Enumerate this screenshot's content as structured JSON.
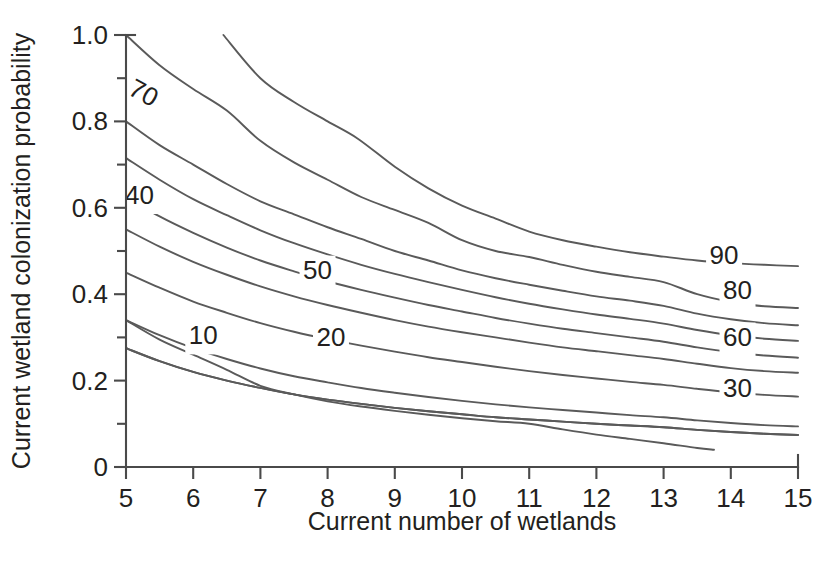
{
  "figure": {
    "clipped_title": "",
    "background_color": "#ffffff",
    "line_color": "#5a5a5a",
    "axis_color": "#4a4a4a",
    "text_color": "#231f20"
  },
  "chart_data": {
    "type": "line",
    "title": "",
    "xlabel": "Current number of wetlands",
    "ylabel": "Current wetland colonization probability",
    "xlim": [
      5,
      15
    ],
    "ylim": [
      0,
      1.0
    ],
    "grid": false,
    "legend": "inline-contour-labels",
    "x_ticks": [
      5,
      6,
      7,
      8,
      9,
      10,
      11,
      12,
      13,
      14,
      15
    ],
    "x_tick_labels": [
      "5",
      "6",
      "7",
      "8",
      "9",
      "10",
      "11",
      "12",
      "13",
      "14",
      "15"
    ],
    "y_ticks": [
      0,
      0.2,
      0.4,
      0.6,
      0.8,
      1.0
    ],
    "y_tick_labels": [
      "0",
      "0.2",
      "0.4",
      "0.6",
      "0.8",
      "1.0"
    ],
    "y_minor_ticks": [
      0.1,
      0.3,
      0.5,
      0.7,
      0.9
    ],
    "series": [
      {
        "name": "100",
        "label": "",
        "label_x": null,
        "label_y": null,
        "points": [
          [
            6.45,
            1.0
          ],
          [
            7.0,
            0.9
          ],
          [
            7.5,
            0.845
          ],
          [
            8.0,
            0.8
          ],
          [
            8.45,
            0.76
          ],
          [
            9.0,
            0.695
          ],
          [
            9.5,
            0.645
          ],
          [
            10.0,
            0.605
          ],
          [
            10.5,
            0.575
          ],
          [
            11.0,
            0.545
          ],
          [
            11.5,
            0.525
          ],
          [
            12.0,
            0.51
          ],
          [
            12.5,
            0.497
          ],
          [
            13.0,
            0.487
          ],
          [
            13.5,
            0.478
          ],
          [
            14.0,
            0.472
          ],
          [
            14.5,
            0.468
          ],
          [
            15.0,
            0.465
          ]
        ]
      },
      {
        "name": "90",
        "label": "90",
        "label_x": 13.9,
        "label_y": 0.485,
        "points": [
          [
            5.0,
            1.0
          ],
          [
            5.5,
            0.93
          ],
          [
            6.0,
            0.875
          ],
          [
            6.5,
            0.825
          ],
          [
            7.0,
            0.755
          ],
          [
            7.5,
            0.705
          ],
          [
            8.0,
            0.665
          ],
          [
            8.5,
            0.625
          ],
          [
            9.0,
            0.595
          ],
          [
            9.5,
            0.565
          ],
          [
            10.0,
            0.525
          ],
          [
            10.5,
            0.5
          ],
          [
            11.0,
            0.486
          ],
          [
            11.5,
            0.468
          ],
          [
            12.0,
            0.452
          ],
          [
            12.5,
            0.44
          ],
          [
            13.0,
            0.428
          ],
          [
            13.5,
            0.4
          ],
          [
            14.0,
            0.382
          ],
          [
            14.5,
            0.372
          ],
          [
            15.0,
            0.368
          ]
        ]
      },
      {
        "name": "85",
        "label": "",
        "label_x": null,
        "label_y": null,
        "points": [
          [
            5.0,
            0.8
          ],
          [
            5.5,
            0.745
          ],
          [
            6.0,
            0.7
          ],
          [
            6.5,
            0.655
          ],
          [
            7.0,
            0.615
          ],
          [
            7.5,
            0.585
          ],
          [
            8.0,
            0.555
          ],
          [
            8.5,
            0.528
          ],
          [
            9.0,
            0.5
          ],
          [
            9.5,
            0.478
          ],
          [
            10.0,
            0.455
          ],
          [
            10.5,
            0.437
          ],
          [
            11.0,
            0.422
          ],
          [
            11.5,
            0.408
          ],
          [
            12.0,
            0.395
          ],
          [
            12.5,
            0.385
          ],
          [
            13.0,
            0.373
          ],
          [
            13.5,
            0.355
          ],
          [
            14.0,
            0.342
          ],
          [
            14.5,
            0.333
          ],
          [
            15.0,
            0.328
          ]
        ]
      },
      {
        "name": "80",
        "label": "80",
        "label_x": 14.1,
        "label_y": 0.405,
        "points": [
          [
            5.0,
            0.715
          ],
          [
            5.5,
            0.665
          ],
          [
            6.0,
            0.62
          ],
          [
            6.5,
            0.583
          ],
          [
            7.0,
            0.548
          ],
          [
            7.5,
            0.518
          ],
          [
            8.0,
            0.492
          ],
          [
            8.5,
            0.468
          ],
          [
            9.0,
            0.447
          ],
          [
            9.5,
            0.428
          ],
          [
            10.0,
            0.41
          ],
          [
            10.5,
            0.393
          ],
          [
            11.0,
            0.378
          ],
          [
            11.5,
            0.365
          ],
          [
            12.0,
            0.353
          ],
          [
            12.5,
            0.343
          ],
          [
            13.0,
            0.332
          ],
          [
            13.5,
            0.317
          ],
          [
            14.0,
            0.305
          ],
          [
            14.5,
            0.297
          ],
          [
            15.0,
            0.292
          ]
        ]
      },
      {
        "name": "70",
        "label": "70",
        "label_x": 5.25,
        "label_y": 0.862,
        "points": [
          [
            5.0,
            0.625
          ],
          [
            5.5,
            0.58
          ],
          [
            6.0,
            0.542
          ],
          [
            6.5,
            0.508
          ],
          [
            7.0,
            0.478
          ],
          [
            7.5,
            0.453
          ],
          [
            8.0,
            0.43
          ],
          [
            8.5,
            0.41
          ],
          [
            9.0,
            0.392
          ],
          [
            9.5,
            0.375
          ],
          [
            10.0,
            0.36
          ],
          [
            10.5,
            0.345
          ],
          [
            11.0,
            0.332
          ],
          [
            11.5,
            0.32
          ],
          [
            12.0,
            0.31
          ],
          [
            12.5,
            0.3
          ],
          [
            13.0,
            0.29
          ],
          [
            13.5,
            0.277
          ],
          [
            14.0,
            0.266
          ],
          [
            14.5,
            0.258
          ],
          [
            15.0,
            0.253
          ]
        ]
      },
      {
        "name": "60",
        "label": "60",
        "label_x": 14.1,
        "label_y": 0.295,
        "points": [
          [
            5.0,
            0.55
          ],
          [
            5.5,
            0.51
          ],
          [
            6.0,
            0.475
          ],
          [
            6.5,
            0.445
          ],
          [
            7.0,
            0.418
          ],
          [
            7.5,
            0.395
          ],
          [
            8.0,
            0.375
          ],
          [
            8.5,
            0.357
          ],
          [
            9.0,
            0.34
          ],
          [
            9.5,
            0.325
          ],
          [
            10.0,
            0.312
          ],
          [
            10.5,
            0.3
          ],
          [
            11.0,
            0.288
          ],
          [
            11.5,
            0.277
          ],
          [
            12.0,
            0.268
          ],
          [
            12.5,
            0.259
          ],
          [
            13.0,
            0.25
          ],
          [
            13.5,
            0.239
          ],
          [
            14.0,
            0.229
          ],
          [
            14.5,
            0.222
          ],
          [
            15.0,
            0.218
          ]
        ]
      },
      {
        "name": "50",
        "label": "50",
        "label_x": 7.85,
        "label_y": 0.45,
        "points": [
          [
            5.0,
            0.45
          ],
          [
            5.5,
            0.415
          ],
          [
            6.0,
            0.383
          ],
          [
            6.5,
            0.357
          ],
          [
            7.0,
            0.333
          ],
          [
            7.5,
            0.313
          ],
          [
            8.0,
            0.296
          ],
          [
            8.5,
            0.281
          ],
          [
            9.0,
            0.267
          ],
          [
            9.5,
            0.254
          ],
          [
            10.0,
            0.243
          ],
          [
            10.5,
            0.232
          ],
          [
            11.0,
            0.222
          ],
          [
            11.5,
            0.213
          ],
          [
            12.0,
            0.205
          ],
          [
            12.5,
            0.197
          ],
          [
            13.0,
            0.19
          ],
          [
            13.5,
            0.181
          ],
          [
            14.0,
            0.173
          ],
          [
            14.5,
            0.167
          ],
          [
            15.0,
            0.163
          ]
        ]
      },
      {
        "name": "40",
        "label": "40",
        "label_x": 5.2,
        "label_y": 0.625,
        "points": [
          [
            5.0,
            0.34
          ],
          [
            5.5,
            0.305
          ],
          [
            6.0,
            0.275
          ],
          [
            6.5,
            0.25
          ],
          [
            7.0,
            0.228
          ],
          [
            7.5,
            0.21
          ],
          [
            8.0,
            0.196
          ],
          [
            8.5,
            0.183
          ],
          [
            9.0,
            0.172
          ],
          [
            9.5,
            0.162
          ],
          [
            10.0,
            0.153
          ],
          [
            10.5,
            0.145
          ],
          [
            11.0,
            0.138
          ],
          [
            11.5,
            0.132
          ],
          [
            12.0,
            0.126
          ],
          [
            12.5,
            0.12
          ],
          [
            13.0,
            0.115
          ],
          [
            13.5,
            0.108
          ],
          [
            14.0,
            0.102
          ],
          [
            14.5,
            0.097
          ],
          [
            15.0,
            0.094
          ]
        ]
      },
      {
        "name": "30",
        "label": "30",
        "label_x": 14.1,
        "label_y": 0.178,
        "points": [
          [
            5.0,
            0.275
          ],
          [
            5.5,
            0.245
          ],
          [
            6.0,
            0.22
          ],
          [
            6.5,
            0.2
          ],
          [
            7.0,
            0.183
          ],
          [
            7.5,
            0.168
          ],
          [
            8.0,
            0.156
          ],
          [
            8.5,
            0.146
          ],
          [
            9.0,
            0.137
          ],
          [
            9.5,
            0.129
          ],
          [
            10.0,
            0.122
          ],
          [
            10.5,
            0.115
          ],
          [
            11.0,
            0.11
          ],
          [
            11.5,
            0.105
          ],
          [
            12.0,
            0.1
          ],
          [
            12.5,
            0.096
          ],
          [
            13.0,
            0.092
          ],
          [
            13.5,
            0.086
          ],
          [
            14.0,
            0.081
          ],
          [
            14.5,
            0.077
          ],
          [
            15.0,
            0.074
          ]
        ]
      },
      {
        "name": "20",
        "label": "20",
        "label_x": 8.05,
        "label_y": 0.295,
        "points": [
          [
            5.0,
            0.275
          ],
          [
            5.5,
            0.245
          ],
          [
            6.0,
            0.22
          ],
          [
            6.5,
            0.2
          ],
          [
            7.0,
            0.183
          ],
          [
            7.5,
            0.168
          ],
          [
            8.0,
            0.156
          ],
          [
            8.5,
            0.146
          ],
          [
            9.0,
            0.137
          ],
          [
            9.5,
            0.129
          ],
          [
            10.0,
            0.122
          ],
          [
            10.5,
            0.115
          ],
          [
            11.0,
            0.11
          ],
          [
            11.5,
            0.105
          ],
          [
            12.0,
            0.1
          ],
          [
            12.5,
            0.096
          ],
          [
            13.0,
            0.092
          ],
          [
            13.5,
            0.086
          ],
          [
            14.0,
            0.081
          ],
          [
            14.5,
            0.077
          ],
          [
            15.0,
            0.074
          ]
        ]
      },
      {
        "name": "10",
        "label": "10",
        "label_x": 6.15,
        "label_y": 0.3,
        "points": [
          [
            5.0,
            0.34
          ],
          [
            5.5,
            0.295
          ],
          [
            6.0,
            0.26
          ],
          [
            6.5,
            0.225
          ],
          [
            7.0,
            0.188
          ],
          [
            7.5,
            0.168
          ],
          [
            8.0,
            0.152
          ],
          [
            8.5,
            0.14
          ],
          [
            9.0,
            0.13
          ],
          [
            9.5,
            0.121
          ],
          [
            10.0,
            0.113
          ],
          [
            10.5,
            0.106
          ],
          [
            11.0,
            0.1
          ],
          [
            11.5,
            0.087
          ],
          [
            12.0,
            0.075
          ],
          [
            12.5,
            0.065
          ],
          [
            13.0,
            0.055
          ],
          [
            13.5,
            0.044
          ],
          [
            13.75,
            0.04
          ]
        ]
      }
    ]
  }
}
